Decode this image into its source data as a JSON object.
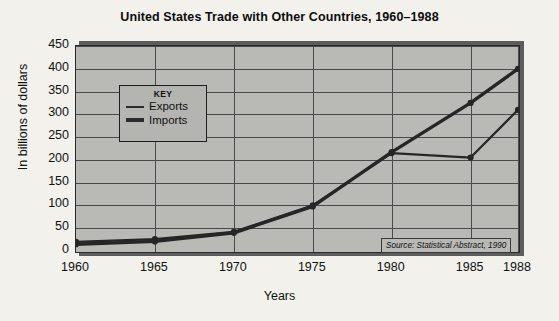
{
  "chart_data": {
    "type": "line",
    "title": "United States Trade with Other Countries, 1960–1988",
    "xlabel": "Years",
    "ylabel": "In billions of dollars",
    "x": [
      1960,
      1965,
      1970,
      1975,
      1980,
      1985,
      1988
    ],
    "xticklabels": [
      "1960",
      "1965",
      "1970",
      "1975",
      "1980",
      "1985",
      "1988"
    ],
    "yticks": [
      0,
      50,
      100,
      150,
      200,
      250,
      300,
      350,
      400,
      450
    ],
    "yticklabels": [
      "0",
      "50",
      "100",
      "150",
      "200",
      "250",
      "300",
      "350",
      "400",
      "450"
    ],
    "ylim": [
      0,
      450
    ],
    "grid": true,
    "legend_position": "upper-left-inside",
    "series": [
      {
        "name": "Exports",
        "values": [
          20,
          26,
          42,
          100,
          215,
          205,
          310
        ]
      },
      {
        "name": "Imports",
        "values": [
          15,
          21,
          40,
          98,
          217,
          325,
          400
        ]
      }
    ],
    "annotations": [
      "Source: Statistical Abstract, 1990"
    ]
  },
  "legend": {
    "title": "KEY",
    "items": [
      {
        "label": "Exports"
      },
      {
        "label": "Imports"
      }
    ]
  },
  "source": {
    "note": "Source: Statistical Abstract, 1990"
  }
}
